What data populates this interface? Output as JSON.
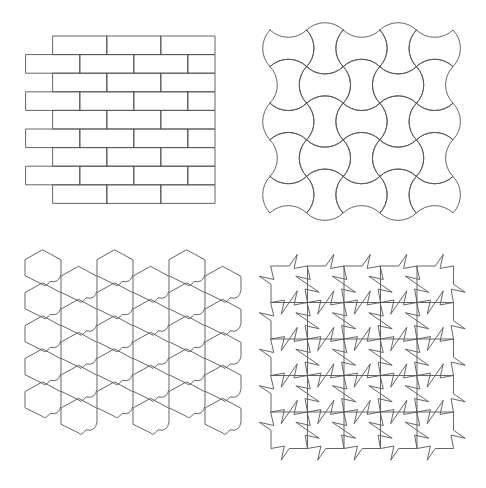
{
  "figure": {
    "background": "#ffffff",
    "line_color": "#555555",
    "panels": [
      {
        "id": "brick",
        "position": "top-left",
        "description": "Running-bond brick tiling",
        "rows": 9,
        "row_height": 18.6,
        "brick_width": 54,
        "origin_x_even": 53,
        "origin_x_odd": 26,
        "right_edge": 215,
        "top": 36
      },
      {
        "id": "arcs",
        "position": "top-right",
        "description": "Curved bow-tie tiling on square grid",
        "cols": 5,
        "rows": 5,
        "cell": 36.6,
        "origin_x": 270,
        "origin_y": 30
      },
      {
        "id": "hex-puzzle",
        "position": "bottom-left",
        "description": "Hexagon-based puzzle tiling with curved tabs",
        "cols": 6,
        "rows": 5,
        "cell_w": 36,
        "cell_h": 33,
        "origin_x": 25,
        "origin_y": 254
      },
      {
        "id": "pinwheel",
        "position": "bottom-right",
        "description": "Square pinwheel tiling with rotated notches",
        "cols": 5,
        "rows": 5,
        "cell": 36.5,
        "origin_x": 271,
        "origin_y": 266
      }
    ]
  }
}
